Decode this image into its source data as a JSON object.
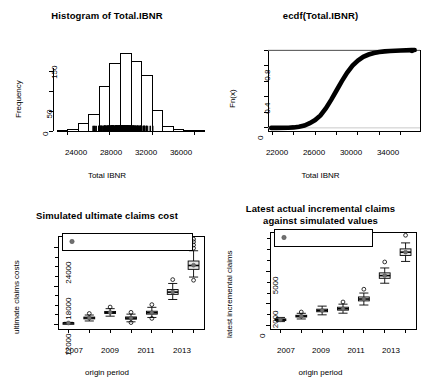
{
  "chart_data": [
    {
      "id": "histogram",
      "type": "bar",
      "title": "Histogram of Total.IBNR",
      "xlabel": "Total IBNR",
      "ylabel": "Frequency",
      "xlim": [
        22600,
        37200
      ],
      "ylim": [
        0,
        200
      ],
      "xticks": [
        24000,
        28000,
        32000,
        36000
      ],
      "yticks": [
        0,
        50,
        100,
        150
      ],
      "ytick_labels": [
        "0",
        "50",
        "",
        "150"
      ],
      "bin_width": 1000,
      "bin_starts": [
        23000,
        24000,
        25000,
        26000,
        27000,
        28000,
        29000,
        30000,
        31000,
        32000,
        33000,
        34000,
        35000,
        36000
      ],
      "values": [
        2,
        3,
        18,
        41,
        112,
        172,
        197,
        176,
        140,
        51,
        12,
        5,
        2,
        1
      ],
      "rug": true,
      "grid": false,
      "legend": "none"
    },
    {
      "id": "ecdf",
      "type": "line",
      "title": "ecdf(Total.IBNR)",
      "xlabel": "Total IBNR",
      "ylabel": "Fn(x)",
      "xlim": [
        21600,
        35800
      ],
      "ylim": [
        -0.04,
        1.0
      ],
      "xticks": [
        22000,
        26000,
        30000,
        34000
      ],
      "xminor": [
        24000,
        28000,
        32000
      ],
      "yticks": [
        0.0,
        0.4,
        0.8
      ],
      "yminor": [
        0.2,
        0.6,
        1.0
      ],
      "x": [
        23500,
        24000,
        24500,
        25000,
        25500,
        26000,
        26500,
        27000,
        27500,
        28000,
        28500,
        29000,
        29500,
        30000,
        30500,
        31000,
        31500,
        32000,
        32500,
        33000,
        34000,
        35000
      ],
      "y": [
        0.002,
        0.006,
        0.014,
        0.03,
        0.06,
        0.1,
        0.16,
        0.25,
        0.36,
        0.48,
        0.6,
        0.71,
        0.8,
        0.865,
        0.912,
        0.942,
        0.962,
        0.974,
        0.982,
        0.988,
        0.994,
        0.998
      ],
      "endpoint_marker": true,
      "grid": false,
      "legend": "none"
    },
    {
      "id": "ultimate-claims",
      "type": "boxplot",
      "title": "Simulated ultimate claims cost",
      "xlabel": "origin period",
      "ylabel": "ultimate claims costs",
      "categories": [
        "2007",
        "2008",
        "2009",
        "2010",
        "2011",
        "2012",
        "2013"
      ],
      "xtick_labels": [
        "2007",
        "",
        "2009",
        "",
        "2011",
        "",
        "2013"
      ],
      "yticks": [
        12000,
        18000,
        24000
      ],
      "ylim": [
        11300,
        25800
      ],
      "legend": {
        "position": "top-left",
        "label": "Mean ultimate claim",
        "marker": "filled-circle",
        "color": "#707070"
      },
      "boxes": [
        {
          "category": "2007",
          "min": 12150,
          "q1": 12200,
          "median": 12240,
          "q3": 12280,
          "max": 12340,
          "mean": 12240,
          "outliers": []
        },
        {
          "category": "2008",
          "min": 12550,
          "q1": 12880,
          "median": 13020,
          "q3": 13160,
          "max": 13480,
          "mean": 13030,
          "outliers": [
            13720
          ]
        },
        {
          "category": "2009",
          "min": 13300,
          "q1": 13720,
          "median": 13880,
          "q3": 14040,
          "max": 14470,
          "mean": 13890,
          "outliers": [
            14720
          ]
        },
        {
          "category": "2010",
          "min": 12420,
          "q1": 12830,
          "median": 13000,
          "q3": 13180,
          "max": 13620,
          "mean": 13010,
          "outliers": [
            13900,
            12300
          ]
        },
        {
          "category": "2011",
          "min": 13100,
          "q1": 13620,
          "median": 13840,
          "q3": 14070,
          "max": 14680,
          "mean": 13850,
          "outliers": [
            15100,
            12950
          ]
        },
        {
          "category": "2012",
          "min": 15900,
          "q1": 16700,
          "median": 17050,
          "q3": 17450,
          "max": 18400,
          "mean": 17080,
          "outliers": [
            19000
          ]
        },
        {
          "category": "2013",
          "min": 19400,
          "q1": 20600,
          "median": 21200,
          "q3": 21900,
          "max": 23500,
          "mean": 21250,
          "outliers": [
            24400,
            24900,
            25300,
            23900,
            18900
          ]
        }
      ]
    },
    {
      "id": "incremental-claims",
      "type": "boxplot",
      "title": "Latest actual incremental claims\nagainst simulated values",
      "title_line1": "Latest actual incremental claims",
      "title_line2": "against simulated values",
      "xlabel": "origin period",
      "ylabel": "latest incremental claims",
      "categories": [
        "2007",
        "2008",
        "2009",
        "2010",
        "2011",
        "2012",
        "2013"
      ],
      "xtick_labels": [
        "2007",
        "",
        "2009",
        "",
        "2011",
        "",
        "2013"
      ],
      "yticks": [
        0,
        2000,
        5000
      ],
      "ylim": [
        -300,
        8600
      ],
      "legend": {
        "position": "top-left",
        "label": "Latest actual",
        "marker": "filled-circle",
        "color": "#707070"
      },
      "boxes": [
        {
          "category": "2007",
          "min": 380,
          "q1": 500,
          "median": 560,
          "q3": 620,
          "max": 760,
          "mean": 560,
          "outliers": []
        },
        {
          "category": "2008",
          "min": 620,
          "q1": 800,
          "median": 880,
          "q3": 960,
          "max": 1140,
          "mean": 880,
          "outliers": [
            1260
          ]
        },
        {
          "category": "2009",
          "min": 1000,
          "q1": 1280,
          "median": 1400,
          "q3": 1520,
          "max": 1800,
          "mean": 1400,
          "outliers": []
        },
        {
          "category": "2010",
          "min": 1150,
          "q1": 1430,
          "median": 1560,
          "q3": 1700,
          "max": 1980,
          "mean": 1560,
          "outliers": [
            2180
          ]
        },
        {
          "category": "2011",
          "min": 1900,
          "q1": 2280,
          "median": 2450,
          "q3": 2640,
          "max": 3000,
          "mean": 2450,
          "outliers": [
            3350
          ]
        },
        {
          "category": "2012",
          "min": 3900,
          "q1": 4350,
          "median": 4600,
          "q3": 4850,
          "max": 5300,
          "mean": 4600,
          "outliers": [
            5850
          ]
        },
        {
          "category": "2013",
          "min": 5900,
          "q1": 6450,
          "median": 6750,
          "q3": 7050,
          "max": 7600,
          "mean": 6750,
          "outliers": [
            8300
          ]
        }
      ]
    }
  ]
}
